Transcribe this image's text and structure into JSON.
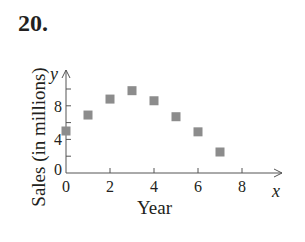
{
  "problem": {
    "number": "20."
  },
  "chart_data": {
    "type": "scatter",
    "title": "",
    "xlabel": "Year",
    "ylabel": "Sales (in millions)",
    "x_axis_var": "x",
    "y_axis_var": "y",
    "x_ticks": [
      "0",
      "2",
      "4",
      "6",
      "8"
    ],
    "y_ticks": [
      "0",
      "4",
      "8"
    ],
    "xlim": [
      0,
      9
    ],
    "ylim": [
      0,
      11
    ],
    "grid": false,
    "marker": "square",
    "marker_color": "#8c8c8c",
    "x": [
      0,
      1,
      2,
      3,
      4,
      5,
      6,
      7
    ],
    "y": [
      5.0,
      6.9,
      8.8,
      9.8,
      8.6,
      6.7,
      4.9,
      2.5
    ]
  }
}
